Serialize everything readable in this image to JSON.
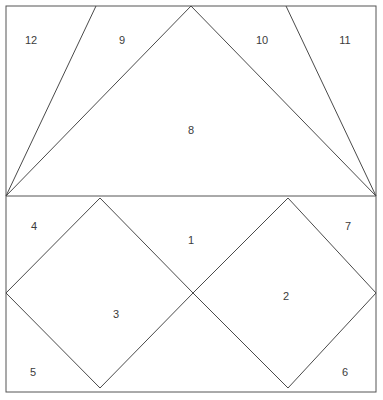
{
  "figure": {
    "kind": "geometric-dissection-diagram",
    "canvas": {
      "width": 383,
      "height": 400
    },
    "style": {
      "background_color": "#ffffff",
      "stroke_color": "#4a4a4a",
      "frame_stroke_color": "#545454",
      "stroke_width": 1,
      "label_color": "#3b3b3b",
      "label_font_size": 11
    },
    "frame": {
      "x": 6,
      "y": 6,
      "width": 370,
      "height": 386
    },
    "divider": {
      "label": "horizontal-midline",
      "x1": 6,
      "y1": 196,
      "x2": 376,
      "y2": 196
    },
    "upper_panel": {
      "name": "upper-triangle-fan",
      "bounds": {
        "top": 6,
        "bottom": 196,
        "left": 6,
        "right": 376
      },
      "points": {
        "left_apex": [
          6,
          196
        ],
        "right_apex": [
          376,
          196
        ],
        "triangle8_apex": [
          191,
          6
        ],
        "top_left_divider": [
          96,
          6
        ],
        "top_right_divider": [
          286,
          6
        ],
        "top_left_corner": [
          6,
          6
        ],
        "top_right_corner": [
          376,
          6
        ]
      },
      "edges": [
        {
          "name": "left-apex-to-top-left-divider",
          "x1": 6,
          "y1": 196,
          "x2": 96,
          "y2": 6
        },
        {
          "name": "left-apex-to-triangle8-apex",
          "x1": 6,
          "y1": 196,
          "x2": 191,
          "y2": 6
        },
        {
          "name": "triangle8-apex-to-right-apex",
          "x1": 191,
          "y1": 6,
          "x2": 376,
          "y2": 196
        },
        {
          "name": "top-right-divider-to-right-apex",
          "x1": 286,
          "y1": 6,
          "x2": 376,
          "y2": 196
        }
      ]
    },
    "lower_panel": {
      "name": "lower-two-squares",
      "bounds": {
        "top": 196,
        "bottom": 392,
        "left": 6,
        "right": 376
      },
      "left_diamond": {
        "name": "square-3",
        "vertices": [
          [
            100,
            198
          ],
          [
            193,
            293
          ],
          [
            100,
            388
          ],
          [
            6,
            293
          ]
        ]
      },
      "right_diamond": {
        "name": "square-2",
        "vertices": [
          [
            288,
            198
          ],
          [
            376,
            293
          ],
          [
            288,
            388
          ],
          [
            193,
            293
          ]
        ]
      }
    },
    "labels": [
      {
        "id": "label-1",
        "text": "1",
        "x": 191,
        "y": 240,
        "region": "lower-interstitial-top"
      },
      {
        "id": "label-2",
        "text": "2",
        "x": 286,
        "y": 296,
        "region": "right-square-interior"
      },
      {
        "id": "label-3",
        "text": "3",
        "x": 116,
        "y": 314,
        "region": "left-square-interior"
      },
      {
        "id": "label-4",
        "text": "4",
        "x": 34,
        "y": 226,
        "region": "lower-top-left-corner"
      },
      {
        "id": "label-5",
        "text": "5",
        "x": 33,
        "y": 372,
        "region": "lower-bottom-left-corner"
      },
      {
        "id": "label-6",
        "text": "6",
        "x": 345,
        "y": 372,
        "region": "lower-bottom-right-corner"
      },
      {
        "id": "label-7",
        "text": "7",
        "x": 348,
        "y": 226,
        "region": "lower-top-right-corner"
      },
      {
        "id": "label-8",
        "text": "8",
        "x": 191,
        "y": 130,
        "region": "upper-central-triangle"
      },
      {
        "id": "label-9",
        "text": "9",
        "x": 122,
        "y": 40,
        "region": "upper-left-inner-triangle"
      },
      {
        "id": "label-10",
        "text": "10",
        "x": 262,
        "y": 40,
        "region": "upper-right-inner-triangle"
      },
      {
        "id": "label-11",
        "text": "11",
        "x": 345,
        "y": 40,
        "region": "upper-far-right-triangle"
      },
      {
        "id": "label-12",
        "text": "12",
        "x": 31,
        "y": 40,
        "region": "upper-far-left-triangle"
      }
    ]
  }
}
